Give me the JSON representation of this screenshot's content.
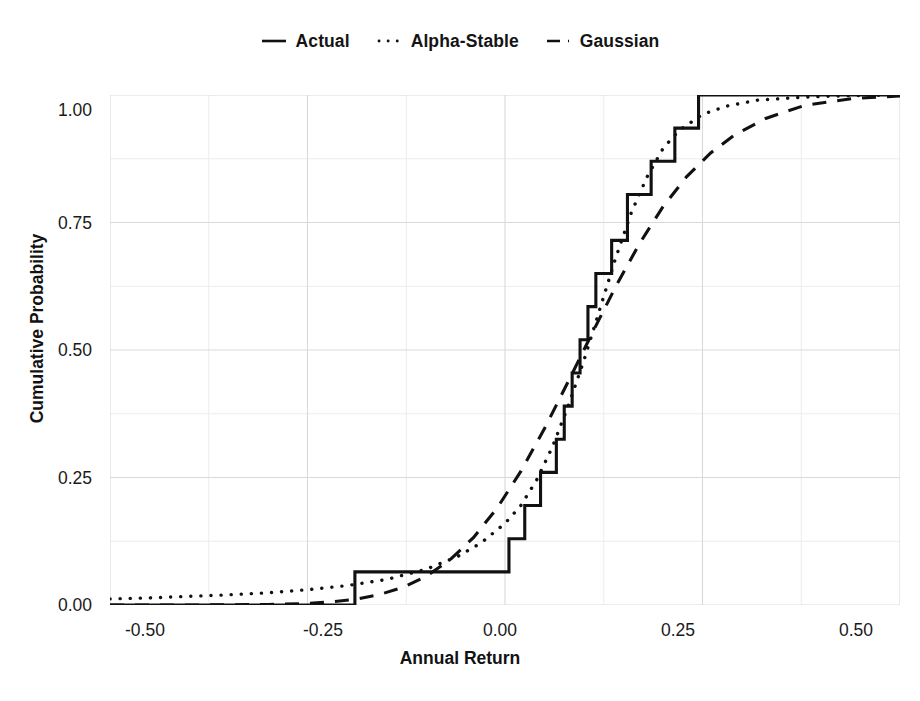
{
  "chart_data": {
    "type": "line",
    "title": "",
    "xlabel": "Annual Return",
    "ylabel": "Cumulative Probability",
    "xlim": [
      -0.5,
      0.5
    ],
    "ylim": [
      0.0,
      1.0
    ],
    "xticks": [
      "-0.50",
      "-0.25",
      "0.00",
      "0.25",
      "0.50"
    ],
    "xtick_values": [
      -0.5,
      -0.25,
      0.0,
      0.25,
      0.5
    ],
    "yticks": [
      "0.00",
      "0.25",
      "0.50",
      "0.75",
      "1.00"
    ],
    "ytick_values": [
      0.0,
      0.25,
      0.5,
      0.75,
      1.0
    ],
    "grid": true,
    "grid_minor": true,
    "legend_position": "top-center",
    "series": [
      {
        "name": "Actual",
        "style": "solid",
        "type": "step",
        "x": [
          -0.5,
          -0.19,
          -0.19,
          -0.035,
          -0.035,
          0.005,
          0.005,
          0.025,
          0.025,
          0.045,
          0.045,
          0.065,
          0.065,
          0.075,
          0.075,
          0.085,
          0.085,
          0.095,
          0.095,
          0.105,
          0.105,
          0.115,
          0.115,
          0.135,
          0.135,
          0.155,
          0.155,
          0.185,
          0.185,
          0.215,
          0.215,
          0.245,
          0.245,
          0.5
        ],
        "y": [
          0.0,
          0.0,
          0.065,
          0.065,
          0.065,
          0.065,
          0.13,
          0.13,
          0.195,
          0.195,
          0.26,
          0.26,
          0.325,
          0.325,
          0.39,
          0.39,
          0.455,
          0.455,
          0.52,
          0.52,
          0.585,
          0.585,
          0.65,
          0.65,
          0.715,
          0.715,
          0.805,
          0.805,
          0.87,
          0.87,
          0.935,
          0.935,
          1.0,
          1.0
        ]
      },
      {
        "name": "Alpha-Stable",
        "style": "dotted",
        "type": "line",
        "x": [
          -0.5,
          -0.45,
          -0.4,
          -0.35,
          -0.3,
          -0.25,
          -0.2,
          -0.15,
          -0.1,
          -0.06,
          -0.03,
          0.0,
          0.02,
          0.04,
          0.06,
          0.08,
          0.1,
          0.12,
          0.14,
          0.16,
          0.18,
          0.2,
          0.22,
          0.25,
          0.28,
          0.32,
          0.38,
          0.44,
          0.5
        ],
        "y": [
          0.012,
          0.014,
          0.017,
          0.02,
          0.024,
          0.03,
          0.038,
          0.05,
          0.07,
          0.095,
          0.122,
          0.16,
          0.195,
          0.245,
          0.31,
          0.39,
          0.48,
          0.58,
          0.68,
          0.77,
          0.84,
          0.895,
          0.93,
          0.962,
          0.978,
          0.99,
          0.996,
          0.999,
          1.0
        ]
      },
      {
        "name": "Gaussian",
        "style": "dashed",
        "type": "line",
        "x": [
          -0.5,
          -0.4,
          -0.3,
          -0.25,
          -0.22,
          -0.19,
          -0.16,
          -0.13,
          -0.1,
          -0.07,
          -0.04,
          -0.01,
          0.02,
          0.05,
          0.08,
          0.11,
          0.14,
          0.17,
          0.2,
          0.23,
          0.26,
          0.29,
          0.33,
          0.38,
          0.44,
          0.5
        ],
        "y": [
          0.0,
          0.0,
          0.001,
          0.003,
          0.006,
          0.011,
          0.02,
          0.034,
          0.056,
          0.088,
          0.132,
          0.19,
          0.262,
          0.346,
          0.438,
          0.532,
          0.624,
          0.708,
          0.781,
          0.84,
          0.886,
          0.921,
          0.954,
          0.98,
          0.993,
          0.998
        ]
      }
    ]
  },
  "legend": {
    "entries": [
      {
        "label": "Actual",
        "key": "solid-line-key"
      },
      {
        "label": "Alpha-Stable",
        "key": "dotted-line-key"
      },
      {
        "label": "Gaussian",
        "key": "dashed-line-key"
      }
    ]
  },
  "axes": {
    "x_label": "Annual Return",
    "y_label": "Cumulative Probability",
    "x_ticks": [
      "-0.50",
      "-0.25",
      "0.00",
      "0.25",
      "0.50"
    ],
    "y_ticks": [
      "0.00",
      "0.25",
      "0.50",
      "0.75",
      "1.00"
    ]
  },
  "colors": {
    "line": "#111111",
    "grid_major": "#d9d9d9",
    "grid_minor": "#ececec",
    "background": "#ffffff",
    "text": "#1a1a1a"
  }
}
